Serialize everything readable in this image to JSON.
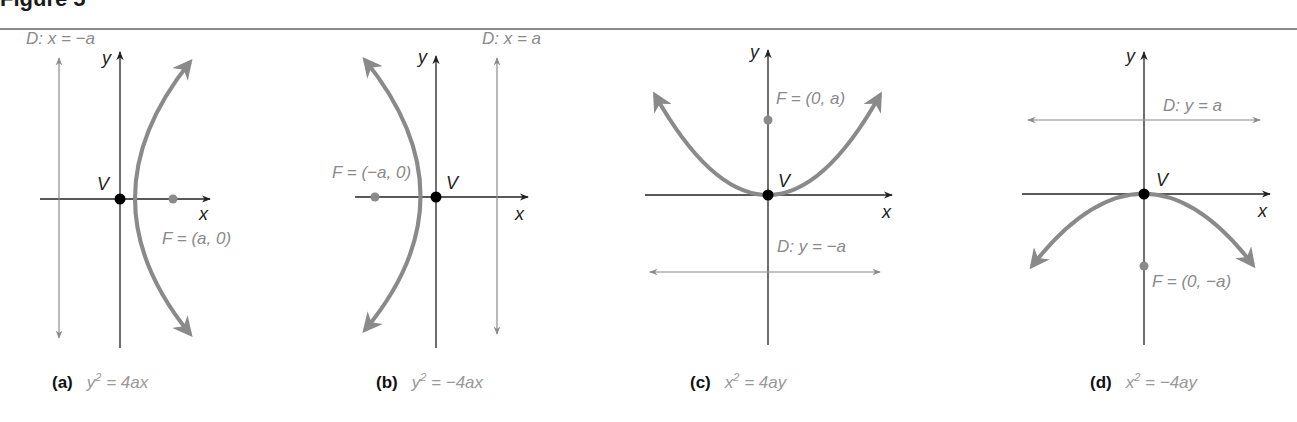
{
  "figure": {
    "title": "Figure 5"
  },
  "colors": {
    "curve": "#8a8a8a",
    "axis": "#222222",
    "focus": "#8a8a8a",
    "vertex": "#000000",
    "label": "#8a8a8a"
  },
  "panels": [
    {
      "id": "a",
      "tag": "(a)",
      "lhs": "y",
      "exp": "2",
      "rhs": " = 4ax",
      "directrix": "D: x = −a",
      "focus": "F = (a, 0)",
      "vertex": "V",
      "x_axis": "x",
      "y_axis": "y"
    },
    {
      "id": "b",
      "tag": "(b)",
      "lhs": "y",
      "exp": "2",
      "rhs": " = −4ax",
      "directrix": "D: x = a",
      "focus": "F = (−a, 0)",
      "vertex": "V",
      "x_axis": "x",
      "y_axis": "y"
    },
    {
      "id": "c",
      "tag": "(c)",
      "lhs": "x",
      "exp": "2",
      "rhs": " = 4ay",
      "directrix": "D: y = −a",
      "focus": "F = (0, a)",
      "vertex": "V",
      "x_axis": "x",
      "y_axis": "y"
    },
    {
      "id": "d",
      "tag": "(d)",
      "lhs": "x",
      "exp": "2",
      "rhs": " = −4ay",
      "directrix": "D: y = a",
      "focus": "F = (0, −a)",
      "vertex": "V",
      "x_axis": "x",
      "y_axis": "y"
    }
  ]
}
